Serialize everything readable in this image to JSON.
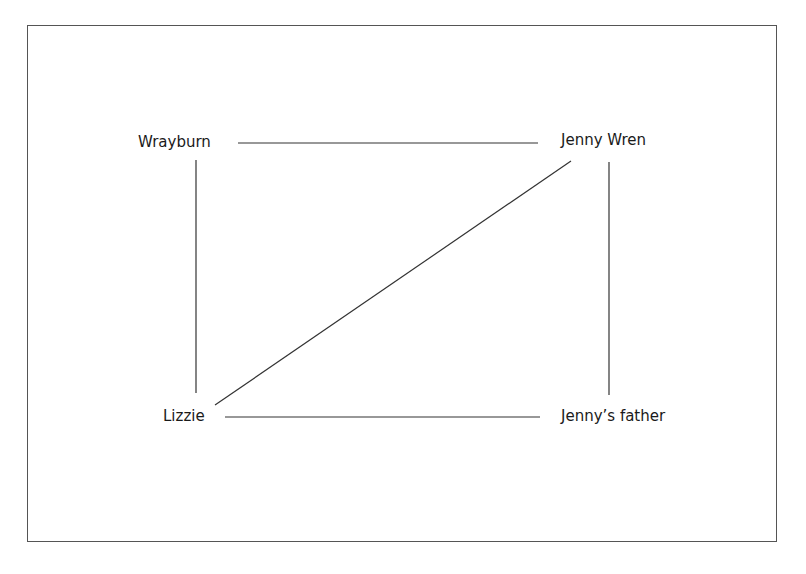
{
  "diagram": {
    "type": "relationship-network",
    "nodes": [
      {
        "id": "wrayburn",
        "label": "Wrayburn"
      },
      {
        "id": "jenny_wren",
        "label": "Jenny Wren"
      },
      {
        "id": "lizzie",
        "label": "Lizzie"
      },
      {
        "id": "jennys_father",
        "label": "Jenny’s father"
      }
    ],
    "edges": [
      {
        "from": "wrayburn",
        "to": "jenny_wren"
      },
      {
        "from": "wrayburn",
        "to": "lizzie"
      },
      {
        "from": "jenny_wren",
        "to": "jennys_father"
      },
      {
        "from": "lizzie",
        "to": "jennys_father"
      },
      {
        "from": "lizzie",
        "to": "jenny_wren"
      }
    ],
    "colors": {
      "line": "#333333",
      "frame": "#555555",
      "text": "#1a1a1a",
      "background": "#ffffff"
    }
  }
}
